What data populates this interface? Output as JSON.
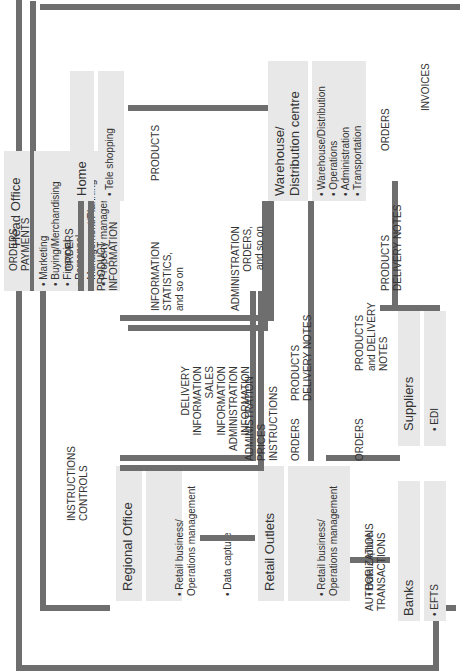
{
  "diagram": {
    "type": "information flow diagram",
    "nodes": {
      "head_office": {
        "title": "Head Office",
        "items": [
          "Marketing",
          "Buying/Merchandising",
          "Financial",
          "Personnel",
          "Management/Planning",
          "Property management"
        ]
      },
      "home": {
        "title": "Home",
        "items": [
          "Tele shopping"
        ]
      },
      "warehouse": {
        "title": "Warehouse/\nDistribution centre",
        "items": [
          "Warehouse/Distribution",
          "Operations",
          "Administration",
          "Transportation"
        ]
      },
      "regional_office": {
        "title": "Regional Office",
        "items": [
          "Retail business/\nOperations management",
          "Data capture"
        ]
      },
      "retail_outlets": {
        "title": "Retail Outlets",
        "items": [
          "Retail business/\nOperations management",
          "Data capture",
          "Customer service"
        ]
      },
      "suppliers": {
        "title": "Suppliers",
        "items": [
          "EDI"
        ]
      },
      "banks": {
        "title": "Banks",
        "items": [
          "EFTS"
        ]
      }
    },
    "flows": {
      "orders_payments": "ORDERS\nPAYMENTS",
      "home_orders": "ORDERS",
      "product_information": "PRODUCT\nINFORMATION",
      "products_home": "PRODUCTS",
      "information_statistics": "INFORMATION\nSTATISTICS,\nand so on",
      "administration_orders": "ADMINISTRATION\nORDERS,\nand so on",
      "invoices": "INVOICES",
      "supplier_orders": "ORDERS",
      "products_delivery_notes_wh": "PRODUCTS\nDELIVERY NOTES",
      "instructions_controls": "INSTRUCTIONS\nCONTROLS",
      "delivery_sales_admin": "DELIVERY\nINFORMATION\nSALES\nINFORMATION\nADMINISTRATION\nINFORMATION",
      "admin_prices_instructions": "ADMINISTRATION\nPRICES\nINSTRUCTIONS",
      "products_delivery_notes_retail": "PRODUCTS\nDELIVERY NOTES",
      "retail_orders": "ORDERS",
      "products_and_delivery_notes": "PRODUCTS\nand DELIVERY\nNOTES",
      "retail_supplier_orders": "ORDERS",
      "authorizations_transactions": "AUTHORIZATIONS\nTRANSACTIONS"
    }
  }
}
